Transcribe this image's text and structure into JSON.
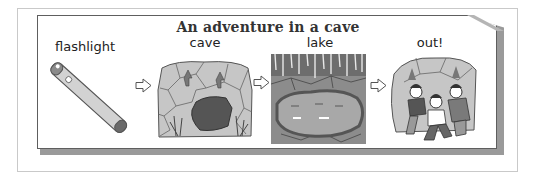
{
  "title": "An adventure in a cave",
  "steps": [
    {
      "label": "flashlight",
      "icon": "flashlight-icon"
    },
    {
      "label": "cave",
      "icon": "cave-icon"
    },
    {
      "label": "lake",
      "icon": "underground-lake-icon"
    },
    {
      "label": "out!",
      "icon": "explorers-exiting-cave-icon"
    }
  ],
  "arrows": [
    "right-arrow-icon",
    "right-arrow-icon",
    "right-arrow-icon"
  ],
  "colors": {
    "panel_border": "#5e5e5e",
    "shadow": "#9a9a9a",
    "rock_light": "#c8c8c8",
    "rock_dark": "#7a7a7a",
    "cave_hole": "#555555",
    "text": "#222222"
  }
}
